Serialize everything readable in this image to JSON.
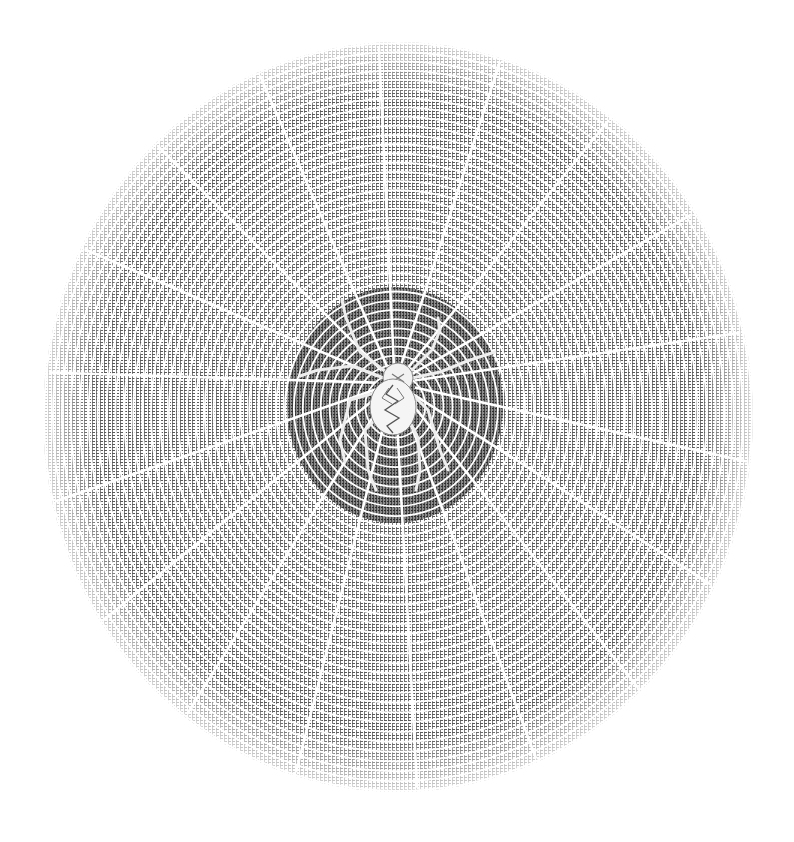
{
  "image": {
    "subject": "spider on orb web engraving",
    "width": 794,
    "height": 842,
    "background": "#ffffff"
  },
  "web": {
    "center": [
      398,
      417
    ],
    "rx": 355,
    "ry": 375,
    "ring_spacing": 9,
    "spoke_count": 18,
    "spoke_color": "#ffffff",
    "ink_color": "#3a3a3a",
    "light_hatch_color": "#9a9a9a"
  },
  "hub": {
    "center": [
      395,
      405
    ],
    "rx": 108,
    "ry": 118,
    "fill": "#6e6e6e"
  },
  "spider": {
    "cephalothorax": {
      "cx": 398,
      "cy": 378,
      "r": 15
    },
    "abdomen": {
      "cx": 393,
      "cy": 405,
      "rx": 23,
      "ry": 28
    },
    "body_color": "#f2f2f2",
    "marking_color": "#555555"
  }
}
